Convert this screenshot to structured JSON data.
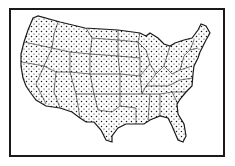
{
  "map": {
    "subject": "Contiguous United States",
    "style": "black-and-white dot distribution map with state boundaries",
    "colors": {
      "background": "#ffffff",
      "ink": "#1a1a1a"
    }
  }
}
